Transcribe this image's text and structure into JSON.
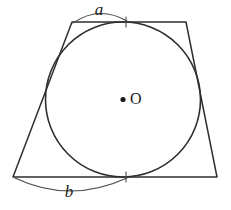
{
  "figure": {
    "type": "geometry-diagram",
    "background_color": "#ffffff",
    "stroke_color": "#2e2e2e",
    "arc_color": "#4a4a4a",
    "label_color": "#1c1c1c",
    "labels": {
      "top_segment": "a",
      "bottom_segment": "b",
      "center_point": "O"
    },
    "shapes": {
      "trapezoid": {
        "name": "trapezoid",
        "points": "72,22 186,22 217,177 13,177",
        "vertices": [
          {
            "name": "top-left",
            "x": 72,
            "y": 22
          },
          {
            "name": "top-right",
            "x": 186,
            "y": 22
          },
          {
            "name": "bottom-right",
            "x": 217,
            "y": 177
          },
          {
            "name": "bottom-left",
            "x": 13,
            "y": 177
          }
        ]
      },
      "circle": {
        "name": "inscribed-circle",
        "cx": 123,
        "cy": 99.5,
        "r": 77.5
      },
      "center_dot": {
        "cx": 123,
        "cy": 99.5,
        "r": 2.6
      },
      "tangent_points": [
        {
          "name": "top-tangent",
          "x": 126,
          "y": 22
        },
        {
          "name": "bottom-tangent",
          "x": 126,
          "y": 177
        }
      ]
    },
    "measure_arcs": {
      "top": {
        "name": "arc-a",
        "path": "M 73 23 Q 99 5 127 21",
        "label_x": 99,
        "label_y": 11
      },
      "bottom": {
        "name": "arc-b",
        "path": "M 15 178 Q 70 204 127 178",
        "label_x": 69,
        "label_y": 193
      }
    },
    "tick_paths": {
      "top": "M 126 17 L 126 27",
      "bottom": "M 126 172 L 126 182"
    }
  }
}
